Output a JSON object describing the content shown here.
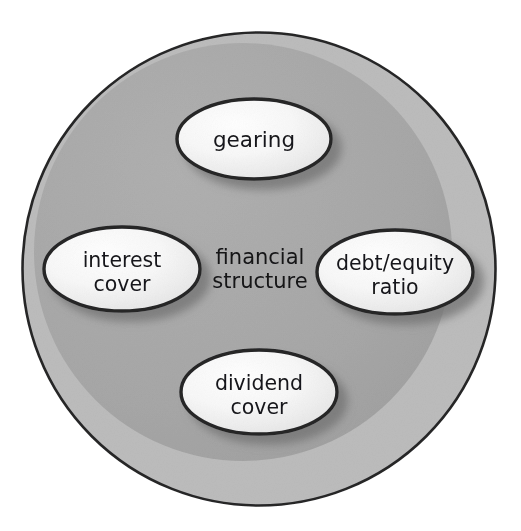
{
  "diagram": {
    "title": "financial structure",
    "type": "concept-bubble-diagram",
    "center": {
      "label_line1": "financial",
      "label_line2": "structure",
      "x": 260,
      "y": 266
    },
    "container": {
      "name": "financial-structure-circle",
      "shape": "circle",
      "cx": 259,
      "cy": 269,
      "r": 237,
      "fill": "#b9b9b9",
      "inner_fill": "#a7a7a7",
      "stroke": "#262628"
    },
    "nodes": [
      {
        "id": "gearing",
        "label_line1": "gearing",
        "label_line2": "",
        "cx": 254,
        "cy": 139,
        "rx": 77,
        "ry": 40,
        "fill": "#f4f4f4",
        "stroke": "#252527"
      },
      {
        "id": "interest-cover",
        "label_line1": "interest",
        "label_line2": "cover",
        "cx": 122,
        "cy": 269,
        "rx": 78,
        "ry": 42,
        "fill": "#f4f4f4",
        "stroke": "#252527"
      },
      {
        "id": "debt-equity-ratio",
        "label_line1": "debt/equity",
        "label_line2": "ratio",
        "cx": 395,
        "cy": 272,
        "rx": 78,
        "ry": 42,
        "fill": "#f4f4f4",
        "stroke": "#252527"
      },
      {
        "id": "dividend-cover",
        "label_line1": "dividend",
        "label_line2": "cover",
        "cx": 259,
        "cy": 392,
        "rx": 78,
        "ry": 42,
        "fill": "#f4f4f4",
        "stroke": "#252527"
      }
    ],
    "colors": {
      "background": "#ffffff",
      "outer_ring": "#b9b9b9",
      "inner_disc": "#a7a7a7",
      "bubble_fill": "#f4f4f4",
      "bubble_highlight": "#fbfbfb",
      "outline": "#252527",
      "shadow": "#8e8e8e",
      "text": "#17171a"
    }
  }
}
